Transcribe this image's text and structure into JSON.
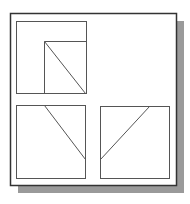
{
  "diagram": {
    "type": "orthographic-views",
    "colors": {
      "background": "#ffffff",
      "frame": "#333333",
      "shadow": "#9a9a9a",
      "line": "#555555"
    },
    "frame": {
      "x": 10,
      "y": 13,
      "w": 166,
      "h": 172
    },
    "shadow": {
      "dx": 8,
      "dy": 8
    },
    "views": [
      {
        "name": "top-left-view",
        "box": {
          "x": 16,
          "y": 21,
          "w": 70,
          "h": 72
        },
        "lines": [
          {
            "x1": 44,
            "y1": 41,
            "x2": 86,
            "y2": 41
          },
          {
            "x1": 44,
            "y1": 41,
            "x2": 44,
            "y2": 93
          },
          {
            "x1": 44,
            "y1": 41,
            "x2": 85,
            "y2": 93
          }
        ]
      },
      {
        "name": "bottom-left-view",
        "box": {
          "x": 16,
          "y": 105,
          "w": 69,
          "h": 73
        },
        "lines": [
          {
            "x1": 44,
            "y1": 105,
            "x2": 85,
            "y2": 159
          }
        ]
      },
      {
        "name": "bottom-right-view",
        "box": {
          "x": 100,
          "y": 106,
          "w": 69,
          "h": 72
        },
        "lines": [
          {
            "x1": 100,
            "y1": 159,
            "x2": 149,
            "y2": 106
          }
        ]
      }
    ]
  }
}
